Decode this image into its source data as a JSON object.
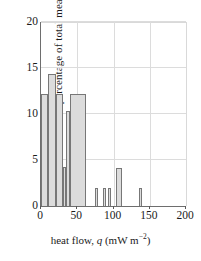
{
  "chart_data": {
    "type": "bar",
    "title": "",
    "subtitle": "",
    "xlabel_plain": "heat flow, q (mW m-2)",
    "xlabel_parts": {
      "pre": "heat flow, ",
      "symbol": "q",
      "post": " (mW m",
      "exponent": "−2",
      "close": ")"
    },
    "ylabel": "percentage of total measurements",
    "xlim": [
      0,
      200
    ],
    "ylim": [
      0,
      20
    ],
    "xticks": [
      0,
      50,
      100,
      150,
      200
    ],
    "xtick_labels": [
      "0",
      "50",
      "100",
      "150",
      "200"
    ],
    "yticks": [
      0,
      5,
      10,
      15,
      20
    ],
    "ytick_labels": [
      "0",
      "5",
      "10",
      "15",
      "20"
    ],
    "grid": "both",
    "legend": "none",
    "bar_fill_color": "#dcdcdc",
    "bar_edge_color": "#777777",
    "axis_color": "#6e6e6e",
    "grid_color": "#dcdcdc",
    "bin_edges": [
      0,
      10,
      20,
      30,
      35,
      40,
      62,
      75,
      79,
      85,
      89,
      93,
      97,
      104,
      112,
      135,
      139
    ],
    "bars": [
      {
        "x0": 0,
        "x1": 10,
        "value": 12.2
      },
      {
        "x0": 10,
        "x1": 20,
        "value": 14.3
      },
      {
        "x0": 20,
        "x1": 30,
        "value": 12.2
      },
      {
        "x0": 30,
        "x1": 35,
        "value": 4.2
      },
      {
        "x0": 35,
        "x1": 40,
        "value": 10.3
      },
      {
        "x0": 40,
        "x1": 62,
        "value": 12.2
      },
      {
        "x0": 75,
        "x1": 79,
        "value": 2.0
      },
      {
        "x0": 85,
        "x1": 89,
        "value": 2.0
      },
      {
        "x0": 93,
        "x1": 97,
        "value": 2.0
      },
      {
        "x0": 104,
        "x1": 112,
        "value": 4.1
      },
      {
        "x0": 135,
        "x1": 139,
        "value": 2.0
      }
    ]
  }
}
